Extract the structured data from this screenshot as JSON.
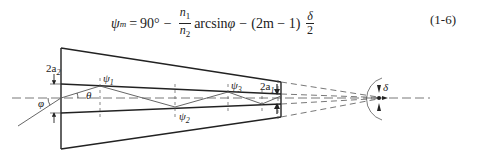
{
  "equation": {
    "lhs": "ψ",
    "lhs_sub": "m",
    "eq_sign": "=",
    "term1": "90°",
    "minus1": "−",
    "frac1_num": "n",
    "frac1_num_sub": "1",
    "frac1_den": "n",
    "frac1_den_sub": "2",
    "func": "arcsin",
    "func_arg": "φ",
    "minus2": "−",
    "paren_expr": "(2m − 1)",
    "frac2_num": "δ",
    "frac2_den": "2",
    "number": "(1-6)"
  },
  "diagram": {
    "labels": {
      "two_a2": "2a",
      "two_a2_sub": "2",
      "two_a1": "2a",
      "two_a1_sub": "1",
      "psi1": "ψ",
      "psi1_sub": "1",
      "psi2": "ψ",
      "psi2_sub": "2",
      "psi3": "ψ",
      "psi3_sub": "3",
      "theta": "θ",
      "phi": "φ",
      "delta": "δ"
    },
    "colors": {
      "line": "#222222",
      "dashed": "#555555",
      "ray": "#666666"
    }
  }
}
